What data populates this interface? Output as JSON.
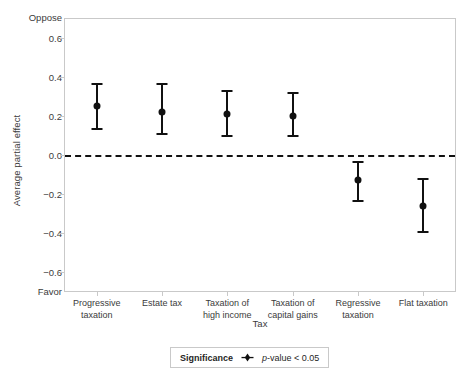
{
  "chart_data": {
    "type": "scatter",
    "title": "",
    "xlabel": "Tax",
    "ylabel": "Average partial effect",
    "ylim": [
      -0.7,
      0.7
    ],
    "yticks": [
      0.6,
      0.4,
      0.2,
      0.0,
      -0.2,
      -0.4,
      -0.6
    ],
    "ytick_labels": [
      "0.6",
      "0.4",
      "0.2",
      "0.0",
      "−0.2",
      "−0.4",
      "−0.6"
    ],
    "y_axis_pole_high": "Oppose",
    "y_axis_pole_low": "Favor",
    "grid": false,
    "reference_line": {
      "value": 0.0,
      "style": "dashed",
      "color": "#111111"
    },
    "categories": [
      "Progressive taxation",
      "Estate tax",
      "Taxation of high income",
      "Taxation of capital gains",
      "Regressive taxation",
      "Flat taxation"
    ],
    "category_label_lines": [
      [
        "Progressive",
        "taxation"
      ],
      [
        "Estate tax",
        ""
      ],
      [
        "Taxation of",
        "high income"
      ],
      [
        "Taxation of",
        "capital gains"
      ],
      [
        "Regressive",
        "taxation"
      ],
      [
        "Flat taxation",
        ""
      ]
    ],
    "values": [
      0.25,
      0.22,
      0.21,
      0.2,
      -0.13,
      -0.26
    ],
    "ci_lower": [
      0.13,
      0.1,
      0.09,
      0.09,
      -0.24,
      -0.4
    ],
    "ci_upper": [
      0.37,
      0.37,
      0.33,
      0.32,
      -0.03,
      -0.12
    ],
    "marker_color": "#111111",
    "significance": [
      true,
      true,
      true,
      true,
      true,
      true
    ]
  },
  "legend": {
    "title": "Significance",
    "marker": "diamond-marker-icon",
    "entry": "p-value < 0.05",
    "entry_italic_prefix": "p",
    "entry_rest": "-value < 0.05"
  }
}
